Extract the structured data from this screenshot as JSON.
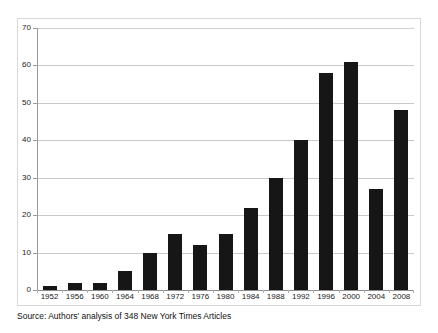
{
  "figure": {
    "background_color": "#ffffff",
    "frame_color": "#d8d8d8",
    "source_note": "Source: Authors' analysis of 348 New York Times Articles"
  },
  "chart_data": {
    "type": "bar",
    "title": "",
    "subtitle": "",
    "xlabel": "",
    "ylabel": "",
    "categories": [
      "1952",
      "1956",
      "1960",
      "1964",
      "1968",
      "1972",
      "1976",
      "1980",
      "1984",
      "1988",
      "1992",
      "1996",
      "2000",
      "2004",
      "2008"
    ],
    "values": [
      1,
      2,
      2,
      5,
      10,
      15,
      12,
      15,
      22,
      30,
      40,
      58,
      61,
      27,
      48
    ],
    "ylim": [
      0,
      70
    ],
    "yticks": [
      0,
      10,
      20,
      30,
      40,
      50,
      60,
      70
    ],
    "ytick_labels": [
      "0",
      "10",
      "20",
      "30",
      "40",
      "50",
      "60",
      "70"
    ],
    "grid": true,
    "grid_axis": "y",
    "legend": false,
    "legend_position": "none",
    "bar_color": "#161616",
    "gridline_color": "#c9c9c9",
    "axis_color": "#9a9a9a"
  }
}
